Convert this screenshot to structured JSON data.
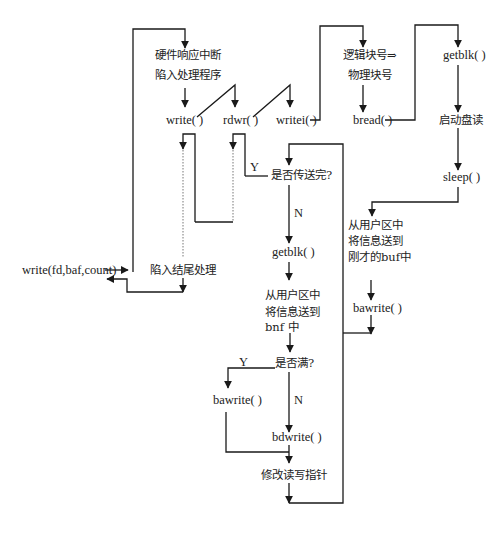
{
  "diagram": {
    "type": "flowchart",
    "topic": "write system call flow",
    "entry": "write(fd,baf,count)",
    "nodes": {
      "hw_interrupt_1": "硬件响应中断",
      "hw_interrupt_2": "陷入处理程序",
      "write": "write( )",
      "rdwr": "rdwr( )",
      "writei": "writei( )",
      "logic_block": "逻辑块号⇒",
      "phys_block": "物理块号",
      "bread": "bread( )",
      "getblk_right": "getblk( )",
      "start_disk_read": "启动盘读",
      "sleep": "sleep( )",
      "copy_right_1": "从用户区中",
      "copy_right_2": "将信息送到",
      "copy_right_3": "刚才的buf中",
      "bawrite_right": "bawrite( )",
      "transfer_done": "是否传送完?",
      "getblk_center": "getblk( )",
      "copy_center_1": "从用户区中",
      "copy_center_2": "将信息送到",
      "copy_center_3": "bnf 中",
      "is_full": "是否满?",
      "bawrite_left": "bawrite( )",
      "bdwrite": "bdwrite( )",
      "update_pointer": "修改读写指针",
      "trap_end": "陷入结尾处理",
      "entry_call": "write(fd,baf,count)"
    },
    "labels": {
      "transfer_done_yes": "Y",
      "transfer_done_no": "N",
      "is_full_yes": "Y",
      "is_full_no": "N"
    },
    "edges": [
      {
        "from": "write(fd,baf,count)",
        "to": "硬件响应中断 陷入处理程序"
      },
      {
        "from": "硬件响应中断 陷入处理程序",
        "to": "write( )"
      },
      {
        "from": "write( )",
        "to": "rdwr( )"
      },
      {
        "from": "rdwr( )",
        "to": "writei( )"
      },
      {
        "from": "writei( )",
        "to": "逻辑块号⇒物理块号"
      },
      {
        "from": "逻辑块号⇒物理块号",
        "to": "bread( )"
      },
      {
        "from": "bread( )",
        "to": "getblk( )"
      },
      {
        "from": "getblk( )",
        "to": "启动盘读"
      },
      {
        "from": "启动盘读",
        "to": "sleep( )"
      },
      {
        "from": "sleep( )",
        "to": "从用户区中将信息送到刚才的buf中"
      },
      {
        "from": "从用户区中将信息送到刚才的buf中",
        "to": "bawrite( )"
      },
      {
        "from": "bawrite( )",
        "to": "是否传送完?"
      },
      {
        "from": "是否传送完?",
        "to": "rdwr( )",
        "label": "Y"
      },
      {
        "from": "是否传送完?",
        "to": "getblk( )",
        "label": "N"
      },
      {
        "from": "getblk( )",
        "to": "从用户区中将信息送到bnf中"
      },
      {
        "from": "从用户区中将信息送到bnf中",
        "to": "是否满?"
      },
      {
        "from": "是否满?",
        "to": "bawrite( )",
        "label": "Y"
      },
      {
        "from": "是否满?",
        "to": "bdwrite( )",
        "label": "N"
      },
      {
        "from": "bawrite( )",
        "to": "修改读写指针"
      },
      {
        "from": "bdwrite( )",
        "to": "修改读写指针"
      },
      {
        "from": "修改读写指针",
        "to": "是否传送完?"
      },
      {
        "from": "rdwr( )",
        "to": "write( )"
      },
      {
        "from": "write( )",
        "to": "陷入结尾处理"
      },
      {
        "from": "陷入结尾处理",
        "to": "write(fd,baf,count)"
      }
    ]
  }
}
